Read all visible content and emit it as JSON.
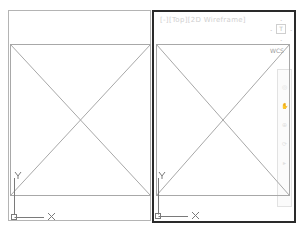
{
  "left_viewport": {
    "name": "model-viewport-left",
    "ucs": {
      "x_label": "X",
      "y_label": "Y"
    }
  },
  "right_viewport": {
    "name": "model-viewport-right-active",
    "label": "[-][Top][2D Wireframe]",
    "viewcube": {
      "face_label": "T",
      "compass_marks": [
        "N",
        "W",
        "E",
        "S"
      ]
    },
    "wcs_label": "WCS",
    "navbar": {
      "tools": [
        "steering-wheel",
        "pan",
        "zoom",
        "orbit",
        "showmotion"
      ]
    },
    "ucs": {
      "x_label": "X",
      "y_label": "Y"
    }
  },
  "colors": {
    "background": "#ffffff",
    "geometry_line": "#a8a8a8",
    "active_border": "#2a2a2a",
    "inactive_border": "#b4b4b4",
    "ucs_line": "#7a7a7a"
  }
}
